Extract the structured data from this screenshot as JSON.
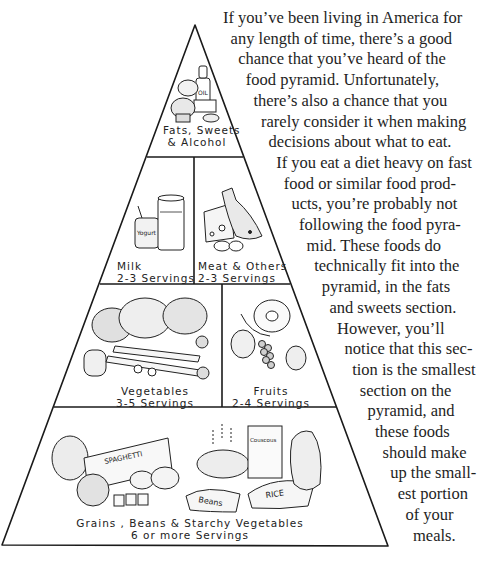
{
  "pyramid": {
    "line_color": "#1a1a1a",
    "sections": [
      {
        "id": "fats",
        "name": "Fats, Sweets",
        "name2": "& Alcohol",
        "servings": "",
        "illustration": "oil bottle, butter dish, cake and candy"
      },
      {
        "id": "milk",
        "name": "Milk",
        "servings": "2-3 Servings",
        "illustration": "yogurt cup and glass of milk"
      },
      {
        "id": "meat",
        "name": "Meat & Others",
        "servings": "2-3 Servings",
        "illustration": "cheese wedge, fish and eggs"
      },
      {
        "id": "vegetables",
        "name": "Vegetables",
        "servings": "3-5 Servings",
        "illustration": "cabbage, broccoli, pepper, carrots and mushrooms"
      },
      {
        "id": "fruits",
        "name": "Fruits",
        "servings": "2-4 Servings",
        "illustration": "melon, banana, pear and grapes"
      },
      {
        "id": "grains",
        "name": "Grains , Beans & Starchy Vegetables",
        "servings": "6 or more Servings",
        "illustration": "bread, spaghetti box, potatoes, bean bag, bowl, couscous box, rice bag and squash",
        "package_labels": {
          "spaghetti": "SPAGHETTI",
          "beans": "Beans",
          "rice": "RICE",
          "couscous": "Couscous",
          "oil": "OIL",
          "yogurt": "Yogurt"
        }
      }
    ]
  },
  "article": {
    "lines": [
      "If you’ve been living in America for",
      "any length of time, there’s a good",
      "chance that you’ve heard of the",
      "food pyramid. Unfortunately,",
      "there’s also a chance that you",
      "rarely consider it when making",
      "decisions about what to eat.",
      "If you eat a diet heavy on fast",
      "food or similar food prod-",
      "ucts, you’re probably not",
      "following the food pyra-",
      "mid. These foods do",
      "technically fit into the",
      "pyramid, in the fats",
      "and sweets section.",
      "However, you’ll",
      "notice that this sec-",
      "tion is the smallest",
      "section on the",
      "pyramid, and",
      "these foods",
      "should make",
      "up the small-",
      "est portion",
      "of your",
      "meals."
    ]
  }
}
